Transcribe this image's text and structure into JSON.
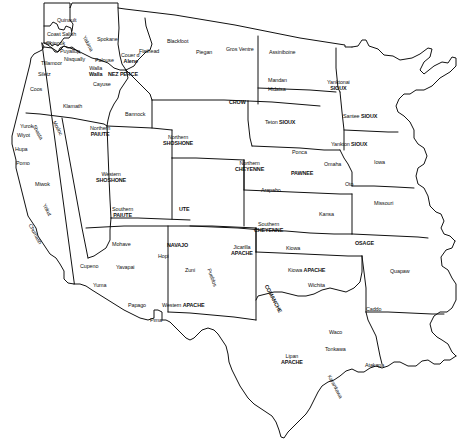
{
  "map": {
    "title": "Native American Tribal Territories of the Western United States",
    "type": "territory-map",
    "width": 458,
    "height": 441,
    "background_color": "#ffffff",
    "line_color": "#111111",
    "label_color": "#111111",
    "regions": [
      {
        "name": "Quinault",
        "x": 57,
        "y": 18,
        "style": "plain",
        "rot": 0
      },
      {
        "name": "Coast Salish",
        "x": 47,
        "y": 32,
        "style": "plain",
        "rot": 0
      },
      {
        "name": "Chinook",
        "x": 46,
        "y": 41,
        "style": "plain",
        "rot": 0
      },
      {
        "name": "Puyallup",
        "x": 60,
        "y": 49,
        "style": "plain",
        "rot": 0
      },
      {
        "name": "Nisqually",
        "x": 64,
        "y": 57,
        "style": "plain",
        "rot": 0
      },
      {
        "name": "Yakima",
        "x": 86,
        "y": 35,
        "style": "plain",
        "rot": 62
      },
      {
        "name": "Spokane",
        "x": 97,
        "y": 37,
        "style": "plain",
        "rot": 0
      },
      {
        "name": "Palouse",
        "x": 95,
        "y": 58,
        "style": "plain",
        "rot": 0
      },
      {
        "name": "Walla Walla",
        "x": 89,
        "y": 66,
        "style": "stack2",
        "rot": 0
      },
      {
        "name": "NEZ PERCE",
        "x": 108,
        "y": 72,
        "style": "bold",
        "rot": 0
      },
      {
        "name": "Cayuse",
        "x": 93,
        "y": 82,
        "style": "plain",
        "rot": 0
      },
      {
        "name": "Couer d' Alene",
        "x": 121,
        "y": 53,
        "style": "stack2",
        "rot": 0
      },
      {
        "name": "Tillamoor",
        "x": 41,
        "y": 61,
        "style": "plain",
        "rot": 0
      },
      {
        "name": "Siletz",
        "x": 38,
        "y": 72,
        "style": "plain",
        "rot": 0
      },
      {
        "name": "Coos",
        "x": 30,
        "y": 87,
        "style": "plain",
        "rot": 0
      },
      {
        "name": "Klamath",
        "x": 63,
        "y": 104,
        "style": "plain",
        "rot": 0
      },
      {
        "name": "Flathead",
        "x": 139,
        "y": 49,
        "style": "plain",
        "rot": 0
      },
      {
        "name": "Blackfoot",
        "x": 167,
        "y": 39,
        "style": "plain",
        "rot": 0
      },
      {
        "name": "Piegan",
        "x": 196,
        "y": 50,
        "style": "plain",
        "rot": 0
      },
      {
        "name": "Gros Ventre",
        "x": 226,
        "y": 47,
        "style": "plain",
        "rot": 0
      },
      {
        "name": "Assiniboine",
        "x": 269,
        "y": 50,
        "style": "plain",
        "rot": 0
      },
      {
        "name": "Mandan",
        "x": 268,
        "y": 78,
        "style": "plain",
        "rot": 0
      },
      {
        "name": "Hidatsa",
        "x": 268,
        "y": 87,
        "style": "plain",
        "rot": 0
      },
      {
        "name": "Yanktonai SIOUX",
        "x": 327,
        "y": 80,
        "style": "stack2mix",
        "rot": 0
      },
      {
        "name": "Santee SIOUX",
        "x": 343,
        "y": 114,
        "style": "mix",
        "rot": 0
      },
      {
        "name": "CROW",
        "x": 229,
        "y": 100,
        "style": "bold",
        "rot": 0
      },
      {
        "name": "Teton SIOUX",
        "x": 265,
        "y": 120,
        "style": "mix",
        "rot": 0
      },
      {
        "name": "Yankton SIOUX",
        "x": 331,
        "y": 142,
        "style": "mix",
        "rot": 0
      },
      {
        "name": "Iowa",
        "x": 374,
        "y": 160,
        "style": "plain",
        "rot": 0
      },
      {
        "name": "Ponca",
        "x": 292,
        "y": 150,
        "style": "plain",
        "rot": 0
      },
      {
        "name": "Omaha",
        "x": 324,
        "y": 162,
        "style": "plain",
        "rot": 0
      },
      {
        "name": "PAWNEE",
        "x": 291,
        "y": 171,
        "style": "bold",
        "rot": 0
      },
      {
        "name": "Oto",
        "x": 345,
        "y": 182,
        "style": "plain",
        "rot": 0
      },
      {
        "name": "Missouri",
        "x": 374,
        "y": 201,
        "style": "plain",
        "rot": 0
      },
      {
        "name": "Bannock",
        "x": 125,
        "y": 112,
        "style": "plain",
        "rot": 0
      },
      {
        "name": "Northern PAIUTE",
        "x": 90,
        "y": 126,
        "style": "stack2",
        "rot": 0
      },
      {
        "name": "Northern SHOSHONE",
        "x": 163,
        "y": 135,
        "style": "stack2",
        "rot": 0
      },
      {
        "name": "Northern CHEYENNE",
        "x": 235,
        "y": 161,
        "style": "stack2",
        "rot": 0
      },
      {
        "name": "Arapaho",
        "x": 261,
        "y": 188,
        "style": "plain",
        "rot": 0
      },
      {
        "name": "Kansa",
        "x": 319,
        "y": 212,
        "style": "plain",
        "rot": 0
      },
      {
        "name": "Yurok",
        "x": 20,
        "y": 124,
        "style": "plain",
        "rot": 0
      },
      {
        "name": "Wiyot",
        "x": 17,
        "y": 133,
        "style": "plain",
        "rot": 0
      },
      {
        "name": "Shasta",
        "x": 36,
        "y": 124,
        "style": "plain",
        "rot": 62
      },
      {
        "name": "Modoc",
        "x": 56,
        "y": 120,
        "style": "plain",
        "rot": 62
      },
      {
        "name": "Hupa",
        "x": 15,
        "y": 147,
        "style": "plain",
        "rot": 0
      },
      {
        "name": "Pomo",
        "x": 16,
        "y": 161,
        "style": "plain",
        "rot": 0
      },
      {
        "name": "Miwok",
        "x": 35,
        "y": 182,
        "style": "plain",
        "rot": 0
      },
      {
        "name": "Yokut",
        "x": 46,
        "y": 203,
        "style": "plain",
        "rot": 62
      },
      {
        "name": "Chumash",
        "x": 32,
        "y": 223,
        "style": "plain",
        "rot": 62
      },
      {
        "name": "Western SHOSHONE",
        "x": 96,
        "y": 172,
        "style": "stack2",
        "rot": 0
      },
      {
        "name": "Southern PAIUTE",
        "x": 112,
        "y": 207,
        "style": "stack2",
        "rot": 0
      },
      {
        "name": "UTE",
        "x": 179,
        "y": 207,
        "style": "bold",
        "rot": 0
      },
      {
        "name": "Southern CHEYENNE",
        "x": 254,
        "y": 222,
        "style": "stack2",
        "rot": 0
      },
      {
        "name": "OSAGE",
        "x": 355,
        "y": 241,
        "style": "bold",
        "rot": 0
      },
      {
        "name": "Mohave",
        "x": 112,
        "y": 242,
        "style": "plain",
        "rot": 0
      },
      {
        "name": "Yavapai",
        "x": 116,
        "y": 265,
        "style": "plain",
        "rot": 0
      },
      {
        "name": "Cupeno",
        "x": 80,
        "y": 264,
        "style": "plain",
        "rot": 0
      },
      {
        "name": "Yuma",
        "x": 93,
        "y": 283,
        "style": "plain",
        "rot": 0
      },
      {
        "name": "Papago",
        "x": 128,
        "y": 303,
        "style": "plain",
        "rot": 0
      },
      {
        "name": "Pima",
        "x": 150,
        "y": 318,
        "style": "plain",
        "rot": 0
      },
      {
        "name": "NAVAJO",
        "x": 167,
        "y": 243,
        "style": "bold",
        "rot": 0
      },
      {
        "name": "Hopi",
        "x": 158,
        "y": 254,
        "style": "plain",
        "rot": 0
      },
      {
        "name": "Zuni",
        "x": 185,
        "y": 268,
        "style": "plain",
        "rot": 0
      },
      {
        "name": "Pueblos",
        "x": 211,
        "y": 268,
        "style": "plain",
        "rot": 70
      },
      {
        "name": "Western APACHE",
        "x": 162,
        "y": 303,
        "style": "mix",
        "rot": 0
      },
      {
        "name": "Jicarilla APACHE",
        "x": 231,
        "y": 245,
        "style": "stack2",
        "rot": 0
      },
      {
        "name": "Kiowa",
        "x": 286,
        "y": 246,
        "style": "plain",
        "rot": 0
      },
      {
        "name": "Kiowa APACHE",
        "x": 288,
        "y": 268,
        "style": "mix",
        "rot": 0
      },
      {
        "name": "Wichita",
        "x": 308,
        "y": 283,
        "style": "plain",
        "rot": 0
      },
      {
        "name": "COMANCHE",
        "x": 268,
        "y": 284,
        "style": "bold",
        "rot": 62
      },
      {
        "name": "Quapaw",
        "x": 390,
        "y": 269,
        "style": "plain",
        "rot": 0
      },
      {
        "name": "Caddo",
        "x": 366,
        "y": 307,
        "style": "plain",
        "rot": 0
      },
      {
        "name": "Waco",
        "x": 329,
        "y": 330,
        "style": "plain",
        "rot": 0
      },
      {
        "name": "Tonkawa",
        "x": 325,
        "y": 347,
        "style": "plain",
        "rot": 0
      },
      {
        "name": "Lipan APACHE",
        "x": 281,
        "y": 354,
        "style": "stack2",
        "rot": 0
      },
      {
        "name": "Atakapa",
        "x": 365,
        "y": 363,
        "style": "plain",
        "rot": 0
      },
      {
        "name": "Karankawa",
        "x": 331,
        "y": 374,
        "style": "plain",
        "rot": 62
      }
    ]
  }
}
